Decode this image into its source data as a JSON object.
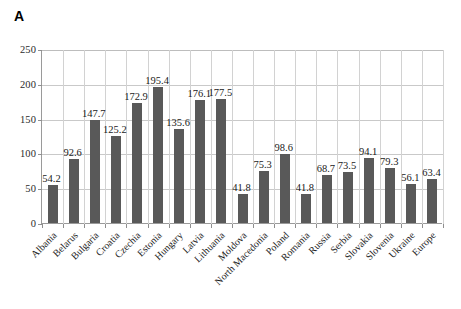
{
  "panel": {
    "letter": "A"
  },
  "chart_data": {
    "type": "bar",
    "title": "A",
    "xlabel": "",
    "ylabel": "",
    "ylim": [
      0,
      250
    ],
    "ytick_labels": [
      "0",
      "50",
      "100",
      "150",
      "200",
      "250"
    ],
    "ytick_values": [
      0,
      50,
      100,
      150,
      200,
      250
    ],
    "grid": "horizontal-and-vertical",
    "legend": "none",
    "bar_color": "#595959",
    "categories": [
      "Albania",
      "Belarus",
      "Bulgaria",
      "Croatia",
      "Czechia",
      "Estonia",
      "Hungary",
      "Latvia",
      "Lithuania",
      "Moldova",
      "North Macedonia",
      "Poland",
      "Romania",
      "Russia",
      "Serbia",
      "Slovakia",
      "Slovenia",
      "Ukraine",
      "Europe"
    ],
    "values": [
      54.2,
      92.6,
      147.7,
      125.2,
      172.9,
      195.4,
      135.6,
      176.1,
      177.5,
      41.8,
      75.3,
      98.6,
      41.8,
      68.7,
      73.5,
      94.1,
      79.3,
      56.1,
      63.4
    ],
    "value_labels": [
      "54.2",
      "92.6",
      "147.7",
      "125.2",
      "172.9",
      "195.4",
      "135.6",
      "176.1",
      "177.5",
      "41.8",
      "75.3",
      "98.6",
      "41.8",
      "68.7",
      "73.5",
      "94.1",
      "79.3",
      "56.1",
      "63.4"
    ]
  }
}
